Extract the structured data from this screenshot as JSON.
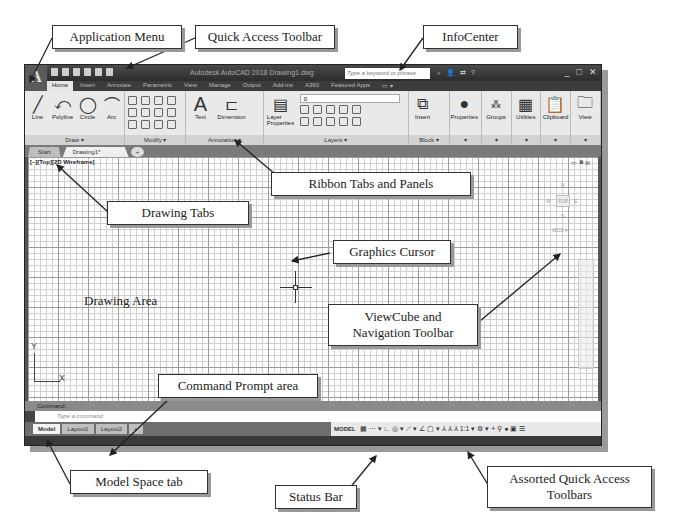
{
  "window": {
    "app_button": "A",
    "title": "Autodesk AutoCAD 2018   Drawing1.dwg",
    "search_placeholder": "Type a keyword or phrase",
    "infocenter_icons": [
      "search-icon",
      "user-icon",
      "exchange-icon",
      "help-icon"
    ],
    "window_controls": [
      "_",
      "□",
      "✕"
    ]
  },
  "ribbon": {
    "tabs": [
      "Home",
      "Insert",
      "Annotate",
      "Parametric",
      "View",
      "Manage",
      "Output",
      "Add-ins",
      "A360",
      "Featured Apps",
      "▭ ▾"
    ],
    "active_tab": "Home",
    "panels": {
      "draw": {
        "title": "Draw ▾",
        "tools": [
          "Line",
          "Polyline",
          "Circle",
          "Arc"
        ]
      },
      "modify": {
        "title": "Modify ▾"
      },
      "annotation": {
        "title": "Annotation ▾",
        "tools": [
          "Text",
          "Dimension"
        ]
      },
      "layers": {
        "title": "Layers ▾",
        "tool": "Layer Properties",
        "current_layer": "0"
      },
      "block": {
        "title": "Block ▾",
        "tool": "Insert"
      },
      "properties": {
        "tool": "Properties",
        "title": "▾"
      },
      "groups": {
        "tool": "Groups",
        "title": "▾"
      },
      "utilities": {
        "tool": "Utilities",
        "title": "▾"
      },
      "clipboard": {
        "tool": "Clipboard",
        "title": "▾"
      },
      "view": {
        "tool": "View",
        "title": "▾"
      }
    }
  },
  "drawing_tabs": {
    "tabs": [
      "Start",
      "Drawing1*"
    ],
    "active": "Drawing1*",
    "close": "×",
    "new": "+"
  },
  "viewport": {
    "label": "[–][Top][2D Wireframe]",
    "viewcube": {
      "top": "TOP",
      "n": "N",
      "s": "S",
      "w": "W",
      "e": "E",
      "wcs": "WCS ▾"
    },
    "ucs": {
      "x": "X",
      "y": "Y"
    }
  },
  "command": {
    "history": "Command:",
    "placeholder": "Type a command"
  },
  "status_bar": {
    "layout_tabs": [
      "Model",
      "Layout1",
      "Layout2"
    ],
    "active": "Model",
    "add": "+",
    "model_label": "MODEL",
    "tool_glyphs": "▦ ⋯ ▾ ∟ ◎ ▾ ⟋ ▾ ∠ ▢ ▾ ⅄ ⅄ ⅄ 1:1 ▾ ⚙ ▾ + ⚲ ● ▣ ☰"
  },
  "callouts": {
    "application_menu": "Application Menu",
    "quick_access_toolbar": "Quick Access Toolbar",
    "infocenter": "InfoCenter",
    "ribbon_tabs_panels": "Ribbon Tabs and Panels",
    "drawing_tabs": "Drawing Tabs",
    "graphics_cursor": "Graphics Cursor",
    "drawing_area": "Drawing Area",
    "viewcube_line1": "ViewCube and",
    "viewcube_line2": "Navigation Toolbar",
    "command_prompt": "Command Prompt area",
    "model_space_tab": "Model Space tab",
    "status_bar": "Status Bar",
    "assorted_line1": "Assorted Quick Access",
    "assorted_line2": "Toolbars"
  }
}
